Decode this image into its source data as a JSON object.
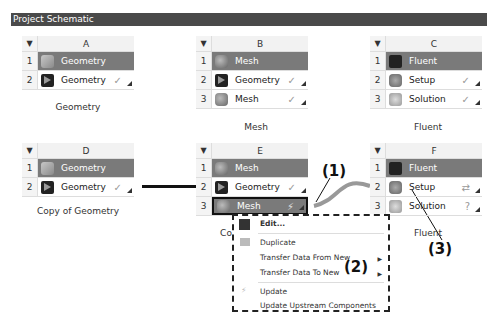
{
  "title": "Project Schematic",
  "systems": [
    {
      "letter": "A",
      "caption": "Geometry",
      "rows": [
        {
          "num": "1",
          "label": "Geometry",
          "icon": "geometry-icon",
          "head": true
        },
        {
          "num": "2",
          "label": "Geometry",
          "icon": "geometry-cell-icon",
          "status": "✓"
        }
      ]
    },
    {
      "letter": "B",
      "caption": "Mesh",
      "rows": [
        {
          "num": "1",
          "label": "Mesh",
          "icon": "mesh-icon",
          "head": true
        },
        {
          "num": "2",
          "label": "Geometry",
          "icon": "geometry-cell-icon",
          "status": "✓"
        },
        {
          "num": "3",
          "label": "Mesh",
          "icon": "mesh-cell-icon",
          "status": "✓"
        }
      ]
    },
    {
      "letter": "C",
      "caption": "Fluent",
      "rows": [
        {
          "num": "1",
          "label": "Fluent",
          "icon": "fluent-icon",
          "head": true
        },
        {
          "num": "2",
          "label": "Setup",
          "icon": "setup-icon",
          "status": "✓"
        },
        {
          "num": "3",
          "label": "Solution",
          "icon": "solution-icon",
          "status": "✓"
        }
      ]
    },
    {
      "letter": "D",
      "caption": "Copy of Geometry",
      "rows": [
        {
          "num": "1",
          "label": "Geometry",
          "icon": "geometry-icon",
          "head": true
        },
        {
          "num": "2",
          "label": "Geometry",
          "icon": "geometry-cell-icon",
          "status": "✓"
        }
      ]
    },
    {
      "letter": "E",
      "caption": "Co",
      "rows": [
        {
          "num": "1",
          "label": "Mesh",
          "icon": "mesh-icon",
          "head": true
        },
        {
          "num": "2",
          "label": "Geometry",
          "icon": "geometry-cell-icon",
          "status": "✓"
        },
        {
          "num": "3",
          "label": "Mesh",
          "icon": "mesh-cell-icon",
          "status": "⚡"
        }
      ]
    },
    {
      "letter": "F",
      "caption": "Fluent",
      "rows": [
        {
          "num": "1",
          "label": "Fluent",
          "icon": "fluent-icon",
          "head": true
        },
        {
          "num": "2",
          "label": "Setup",
          "icon": "setup-icon",
          "status": "⇄"
        },
        {
          "num": "3",
          "label": "Solution",
          "icon": "solution-icon",
          "status": "?"
        }
      ]
    }
  ],
  "context_menu": {
    "items": [
      "Edit...",
      "Duplicate",
      "Transfer Data From New",
      "Transfer Data To New",
      "Update",
      "Update Upstream Components"
    ]
  },
  "annotations": [
    "(1)",
    "(2)",
    "(3)"
  ]
}
